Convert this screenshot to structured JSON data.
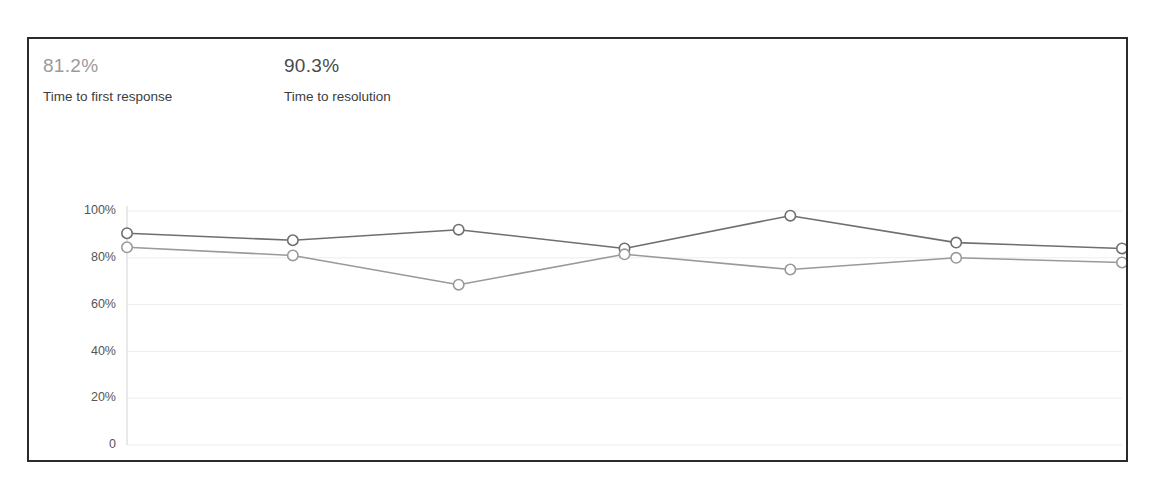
{
  "panel": {
    "name": "support-sla-panel"
  },
  "stats": [
    {
      "value": "81.2%",
      "label": "Time to first response",
      "color": "#9b9b9b"
    },
    {
      "value": "90.3%",
      "label": "Time to resolution",
      "color": "#4a4a4a"
    }
  ],
  "chart_data": {
    "type": "line",
    "title": "",
    "xlabel": "",
    "ylabel": "",
    "categories": [
      "1 Nov",
      "2 Nov",
      "3 Nov",
      "4 Nov",
      "5 Nov",
      "6 Nov",
      "7 Nov"
    ],
    "ylim": [
      0,
      100
    ],
    "ytick_values": [
      0,
      20,
      40,
      60,
      80,
      100
    ],
    "ytick_labels": [
      "0",
      "20%",
      "40%",
      "60%",
      "80%",
      "100%"
    ],
    "grid": true,
    "legend": "none",
    "series": [
      {
        "name": "Time to resolution",
        "color": "#6f6f6f",
        "marker": "circle-open",
        "values": [
          90.5,
          87.5,
          92.0,
          84.0,
          98.0,
          86.5,
          84.0
        ]
      },
      {
        "name": "Time to first response",
        "color": "#9a9a9a",
        "marker": "circle-open",
        "values": [
          84.5,
          81.0,
          68.5,
          81.5,
          75.0,
          80.0,
          78.0
        ]
      }
    ]
  }
}
